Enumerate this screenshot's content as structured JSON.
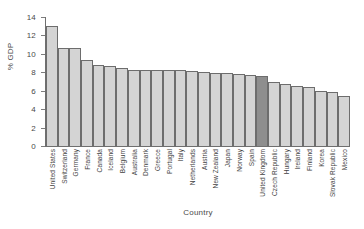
{
  "chart_data": {
    "type": "bar",
    "title": "",
    "xlabel": "Country",
    "ylabel": "% GDP",
    "ylim": [
      0,
      14
    ],
    "yticks": [
      0,
      2,
      4,
      6,
      8,
      10,
      12,
      14
    ],
    "grid": false,
    "legend": "none",
    "highlight_category": "United Kingdom",
    "colors": {
      "bar_fill": "#d4d4d4",
      "bar_fill_highlight": "#8e8e8e",
      "bar_edge": "#6d6d6d",
      "axis": "#6f6f6f",
      "text": "#3f3f3f",
      "background": "#ffffff"
    },
    "categories": [
      "United States",
      "Switzerland",
      "Germany",
      "France",
      "Canada",
      "Iceland",
      "Belgium",
      "Australia",
      "Denmark",
      "Greece",
      "Portugal",
      "Italy",
      "Netherlands",
      "Austria",
      "New Zealand",
      "Japan",
      "Norway",
      "Spain",
      "United Kingdom",
      "Czech Republic",
      "Hungary",
      "Ireland",
      "Finland",
      "Korea",
      "Slovak Republic",
      "Mexico"
    ],
    "values": [
      13.0,
      10.6,
      10.6,
      9.3,
      8.8,
      8.7,
      8.5,
      8.2,
      8.2,
      8.2,
      8.2,
      8.2,
      8.1,
      8.0,
      7.9,
      7.9,
      7.8,
      7.7,
      7.6,
      7.0,
      6.7,
      6.5,
      6.4,
      6.0,
      5.9,
      5.4
    ]
  }
}
